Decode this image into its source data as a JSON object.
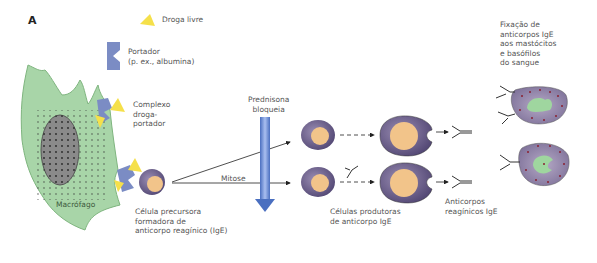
{
  "panel_label": "A",
  "legend": {
    "free_drug": "Droga livre",
    "carrier": "Portador\n(p. ex., albumina)"
  },
  "labels": {
    "complex": "Complexo\ndroga-\nportador",
    "macrophage": "Macrófago",
    "precursor": "Célula precursora\nformadora de\nanticorpo reagínico (IgE)",
    "prednisone": "Prednisona\nbloqueia",
    "mitosis": "Mitose",
    "producing_cells": "Células produtoras\nde anticorpo IgE",
    "antibodies": "Anticorpos\nreagínicos IgE",
    "fixation": "Fixação de\nanticorpos IgE\naos mastócitos\ne basófilos\ndo sangue"
  },
  "colors": {
    "macrophage": "#a8d5a8",
    "drug": "#f5e04a",
    "carrier": "#7b8cc4",
    "cell": "#6e5f8a",
    "nucleus": "#f2c48a",
    "arrow": "#6f8fd0"
  }
}
